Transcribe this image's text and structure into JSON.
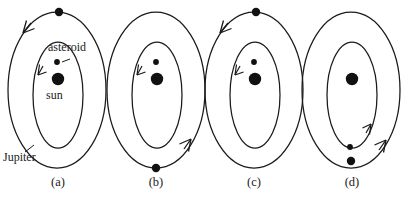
{
  "figure": {
    "title": "",
    "type": "diagram",
    "stroke_color": "#1a1a1a",
    "body_color": "#111111",
    "background": "#ffffff",
    "annotations": {
      "asteroid": "asteroid",
      "sun": "sun",
      "jupiter": "Jupiter"
    },
    "panels": [
      {
        "id": "a",
        "label": "(a)",
        "outer_orbit": "jupiter-orbit",
        "inner_orbit": "asteroid-orbit",
        "jupiter_position": "top",
        "jupiter_arrow": "left",
        "asteroid_position": "top",
        "asteroid_arrow": "left",
        "has_labels": true
      },
      {
        "id": "b",
        "label": "(b)",
        "outer_orbit": "jupiter-orbit",
        "inner_orbit": "asteroid-orbit",
        "jupiter_position": "bottom",
        "jupiter_arrow": "up-right",
        "asteroid_position": "top",
        "asteroid_arrow": "left",
        "has_labels": false
      },
      {
        "id": "c",
        "label": "(c)",
        "outer_orbit": "jupiter-orbit",
        "inner_orbit": "asteroid-orbit",
        "jupiter_position": "top",
        "jupiter_arrow": "left",
        "asteroid_position": "top",
        "asteroid_arrow": "left",
        "has_labels": false
      },
      {
        "id": "d",
        "label": "(d)",
        "outer_orbit": "jupiter-orbit",
        "inner_orbit": "asteroid-orbit",
        "jupiter_position": "bottom",
        "jupiter_arrow": "up-right",
        "asteroid_position": "bottom",
        "asteroid_arrow": "up-right",
        "has_labels": false
      }
    ]
  }
}
